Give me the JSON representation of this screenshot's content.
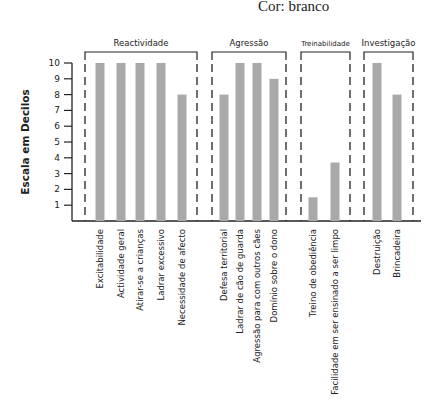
{
  "header": {
    "subtitle": "Cor: branco"
  },
  "chart_data": {
    "type": "bar",
    "title": "",
    "subtitle": "Cor: branco",
    "xlabel": "",
    "ylabel": "Escala em Decilos",
    "ylim": [
      0,
      10
    ],
    "yticks": [
      1,
      2,
      3,
      4,
      5,
      6,
      7,
      8,
      9,
      10
    ],
    "grid": false,
    "bar_color": "#a9a9a9",
    "groups": [
      {
        "name": "Reactividade",
        "categories": [
          "Excitabilidade",
          "Actividade geral",
          "Atirar-se a crianças",
          "Ladrar  excessivo",
          "Necessidade de afecto"
        ],
        "values": [
          10,
          10,
          10,
          10,
          8
        ]
      },
      {
        "name": "Agressão",
        "categories": [
          "Defesa territorial",
          "Ladrar de cão de guarda",
          "Agressão para com outros cães",
          "Domínio sobre o dono"
        ],
        "values": [
          8,
          10,
          10,
          9
        ]
      },
      {
        "name": "Treinabilidade",
        "categories": [
          "Treino de obediência",
          "Facilidade em ser ensinado a ser limpo"
        ],
        "values": [
          1.5,
          3.7
        ]
      },
      {
        "name": "Investigação",
        "categories": [
          "Destruição",
          "Brincadeira"
        ],
        "values": [
          10,
          8
        ]
      }
    ],
    "categories": [
      "Excitabilidade",
      "Actividade geral",
      "Atirar-se a crianças",
      "Ladrar  excessivo",
      "Necessidade de afecto",
      "Defesa territorial",
      "Ladrar de cão de guarda",
      "Agressão para com outros cães",
      "Domínio sobre o dono",
      "Treino de obediência",
      "Facilidade em ser ensinado a ser limpo",
      "Destruição",
      "Brincadeira"
    ],
    "values": [
      10,
      10,
      10,
      10,
      8,
      8,
      10,
      10,
      9,
      1.5,
      3.7,
      10,
      8
    ]
  }
}
